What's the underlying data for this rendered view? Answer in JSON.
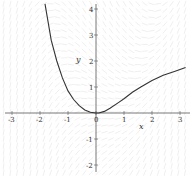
{
  "chart_data": {
    "type": "line",
    "subtype": "direction-field-with-solution-curve",
    "title": "",
    "xlabel": "x",
    "ylabel": "y",
    "xlim": [
      -3.4,
      3.4
    ],
    "ylim": [
      -2.4,
      4.3
    ],
    "grid": false,
    "legend": null,
    "x_ticks": [
      -3,
      -2,
      -1,
      0,
      1,
      2,
      3
    ],
    "y_ticks": [
      -2,
      -1,
      1,
      2,
      3,
      4
    ],
    "x_tick_labels": [
      "-3",
      "-2",
      "-1",
      "0",
      "1",
      "2",
      "3"
    ],
    "y_tick_labels": [
      "-2",
      "-1",
      "1",
      "2",
      "3",
      "4"
    ],
    "series": [
      {
        "name": "solution curve",
        "color": "#333333",
        "x": [
          -1.82,
          -1.6,
          -1.4,
          -1.2,
          -1.0,
          -0.8,
          -0.6,
          -0.4,
          -0.2,
          0.0,
          0.1,
          0.3,
          0.5,
          0.8,
          1.0,
          1.3,
          1.6,
          2.0,
          2.4,
          2.8,
          3.2
        ],
        "y": [
          4.2,
          2.8,
          2.0,
          1.35,
          0.85,
          0.52,
          0.28,
          0.12,
          0.03,
          0.0,
          0.0,
          0.06,
          0.18,
          0.4,
          0.55,
          0.8,
          1.0,
          1.25,
          1.45,
          1.6,
          1.75
        ]
      }
    ],
    "slope_field": {
      "color": "#e4e4e4",
      "description": "faint slope segments covering the plane"
    }
  }
}
